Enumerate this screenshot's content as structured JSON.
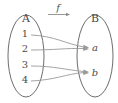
{
  "diagram": {
    "title": "",
    "function_label": "f",
    "domain_set": {
      "name": "A",
      "label": "A",
      "elements": [
        {
          "label": "1",
          "x": 25,
          "y": 37
        },
        {
          "label": "2",
          "x": 25,
          "y": 52
        },
        {
          "label": "3",
          "x": 25,
          "y": 68
        },
        {
          "label": "4",
          "x": 25,
          "y": 83
        }
      ],
      "ellipse": {
        "cx": 26,
        "cy": 56,
        "rx": 18,
        "ry": 41
      }
    },
    "codomain_set": {
      "name": "B",
      "label": "B",
      "elements": [
        {
          "label": "a",
          "x": 95,
          "y": 49
        },
        {
          "label": "b",
          "x": 95,
          "y": 74
        }
      ],
      "ellipse": {
        "cx": 95,
        "cy": 56,
        "rx": 18,
        "ry": 41
      }
    },
    "mappings": [
      {
        "from": "1",
        "to": "a"
      },
      {
        "from": "2",
        "to": "a"
      },
      {
        "from": "3",
        "to": "b"
      },
      {
        "from": "4",
        "to": "b"
      }
    ],
    "colors": {
      "outline": "#6e6e6e",
      "arrow": "#9a9a9a",
      "text": "#4a4a4a",
      "background": "#ffffff"
    }
  }
}
